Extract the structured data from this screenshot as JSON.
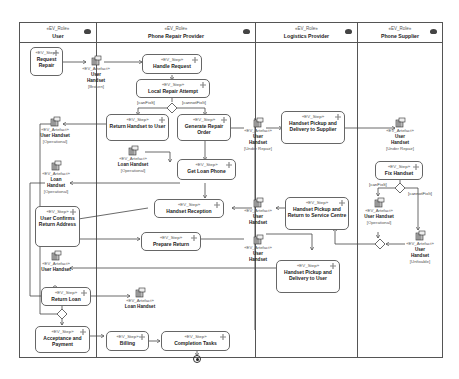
{
  "lanes": [
    {
      "stereotype": "«EV_Role»",
      "name": "User"
    },
    {
      "stereotype": "«EV_Role»",
      "name": "Phone Repair Provider"
    },
    {
      "stereotype": "«EV_Role»",
      "name": "Logistics Provider"
    },
    {
      "stereotype": "«EV_Role»",
      "name": "Phone Supplier"
    }
  ],
  "steps": {
    "request_repair": {
      "stereotype": "«EV_Step»",
      "name": "Request Repair"
    },
    "handle_request": {
      "stereotype": "«EV_Step»",
      "name": "Handle Request"
    },
    "local_repair_attempt": {
      "stereotype": "«EV_Step»",
      "name": "Local Repair Attempt"
    },
    "return_handset_to_user": {
      "stereotype": "«EV_Step»",
      "name": "Return Handset to User"
    },
    "generate_repair_order": {
      "stereotype": "«EV_Step»",
      "name": "Generate Repair Order"
    },
    "get_loan_phone": {
      "stereotype": "«EV_Step»",
      "name": "Get Loan Phone"
    },
    "handset_pickup_delivery_supplier": {
      "stereotype": "«EV_Step»",
      "name": "Handset Pickup and Delivery to Supplier"
    },
    "fix_handset": {
      "stereotype": "«EV_Step»",
      "name": "Fix Handset"
    },
    "handset_reception": {
      "stereotype": "«EV_Step»",
      "name": "Handset Reception"
    },
    "handset_pickup_return_service": {
      "stereotype": "«EV_Step»",
      "name": "Handset Pickup and Return to Service Centre"
    },
    "user_confirm_return_address": {
      "stereotype": "«EV_Step»",
      "name": "User Confirms Return Address"
    },
    "prepare_return": {
      "stereotype": "«EV_Step»",
      "name": "Prepare Return"
    },
    "handset_pickup_delivery_user": {
      "stereotype": "«EV_Step»",
      "name": "Handset Pickup and Delivery to User"
    },
    "return_loan": {
      "stereotype": "«EV_Step»",
      "name": "Return Loan"
    },
    "acceptance_payment": {
      "stereotype": "«EV_Step»",
      "name": "Acceptance and Payment"
    },
    "billing": {
      "stereotype": "«EV_Step»",
      "name": "Billing"
    },
    "completion_tasks": {
      "stereotype": "«EV_Step»",
      "name": "Completion Tasks"
    }
  },
  "artefacts": {
    "user_handset_broken": {
      "stereotype": "«EV_Artefact»",
      "name": "User Handset",
      "state": "[Broken]"
    },
    "user_handset_operational_1": {
      "stereotype": "«EV_Artefact»",
      "name": "User Handset",
      "state": "[Operational]"
    },
    "loan_handset_operational_user": {
      "stereotype": "«EV_Artefact»",
      "name": "Loan Handset",
      "state": "[Operational]"
    },
    "loan_handset_operational_prp": {
      "stereotype": "«EV_Artefact»",
      "name": "Loan Handset",
      "state": "[Operational]"
    },
    "user_handset_under_repair_1": {
      "stereotype": "«EV_Artefact»",
      "name": "User Handset",
      "state": "[Under Repair]"
    },
    "user_handset_under_repair_2": {
      "stereotype": "«EV_Artefact»",
      "name": "User Handset",
      "state": "[Under Repair]"
    },
    "user_handset_operational_supplier": {
      "stereotype": "«EV_Artefact»",
      "name": "User Handset",
      "state": "[Operational]"
    },
    "user_handset_unfixable": {
      "stereotype": "«EV_Artefact»",
      "name": "User Handset",
      "state": "[Unfixable]"
    },
    "user_handset_reception": {
      "stereotype": "«EV_Artefact»",
      "name": "User Handset",
      "state": ""
    },
    "user_handset_prepare": {
      "stereotype": "«EV_Artefact»",
      "name": "User Handset",
      "state": ""
    },
    "user_handset_user_lane": {
      "stereotype": "«EV_Artefact»",
      "name": "User Handset",
      "state": ""
    },
    "loan_handset_returned": {
      "stereotype": "«EV_Artefact»",
      "name": "Loan Handset",
      "state": ""
    }
  },
  "guards": {
    "can_fix_1": "[canFixIt]",
    "cannot_fix_1": "[cannotFixIt]",
    "can_fix_2": "[canFixIt]",
    "cannot_fix_2": "[cannotFixIt]"
  },
  "colors": {
    "line": "#444444",
    "border": "#666666",
    "background": "#ffffff"
  }
}
